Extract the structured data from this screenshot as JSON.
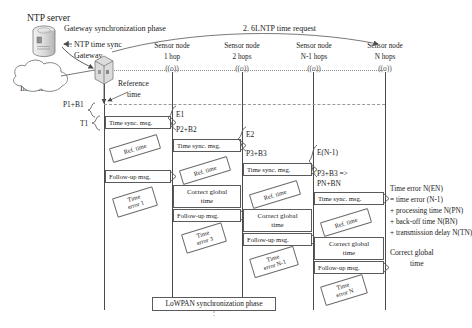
{
  "diagram": {
    "title_ntp_server": "NTP server",
    "phase_gateway": "Gateway synchronization phase",
    "phase_lowpan": "LoWPAN synchronization phase",
    "step1": "1. NTP time sync",
    "step2": "2. 6LNTP time request",
    "gateway_label": "Gateway",
    "internet_label": "Internet",
    "reference_time": "Reference\ntime",
    "reference_time_l1": "Reference",
    "reference_time_l2": "time"
  },
  "columns": [
    {
      "name": "Sensor node",
      "hops": "1 hop",
      "icon": "((o))"
    },
    {
      "name": "Sensor node",
      "hops": "2 hops",
      "icon": "((o))"
    },
    {
      "name": "Sensor node",
      "hops": "N-1 hops",
      "icon": "((o))"
    },
    {
      "name": "Sensor node",
      "hops": "N hops",
      "icon": "((o))"
    }
  ],
  "brace_labels": [
    {
      "text": "P1+B1"
    },
    {
      "text": "T1"
    }
  ],
  "latency_labels": [
    {
      "text": "E1"
    },
    {
      "text": "E2"
    },
    {
      "text": "E(N-1)"
    }
  ],
  "budget_labels": [
    {
      "text": "P2+B2"
    },
    {
      "text": "P3+B3"
    },
    {
      "text": "P3+B3 =>"
    },
    {
      "text": "PN+BN"
    }
  ],
  "messages": {
    "time_sync": "Time sync. msg.",
    "follow_up": "Follow-up msg.",
    "ref_time": "Ref. time",
    "correct_global_l1": "Correct global",
    "correct_global_l2": "time"
  },
  "time_errors": [
    {
      "l1": "Time",
      "l2": "error 1"
    },
    {
      "l1": "Time",
      "l2": "error 3"
    },
    {
      "l1": "Time",
      "l2": "error N-1"
    },
    {
      "l1": "Time",
      "l2": "error N"
    }
  ],
  "error_formula": {
    "line1": "Time error N(EN)",
    "line2": "= time error (N-1)",
    "line3": "+ processing time N(PN)",
    "line4": "+ back-off time N(BN)",
    "line5": "+ transmission delay N(TN)"
  },
  "colors": {
    "ink": "#1a1a1a",
    "line": "#5a5a5a",
    "soft": "#8a8a8a",
    "background": "#ffffff"
  }
}
